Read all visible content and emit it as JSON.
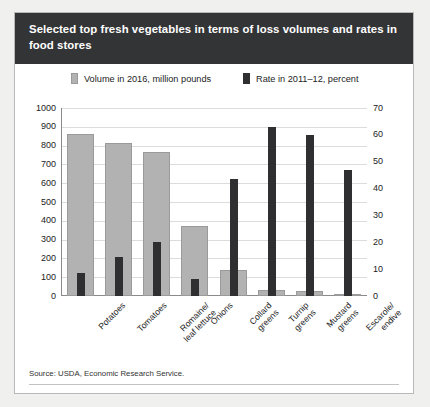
{
  "title": "Selected top fresh vegetables in terms of loss volumes and rates in food stores",
  "legend": {
    "volume": {
      "label": "Volume in 2016, million pounds",
      "color": "#b2b2b2",
      "icon": "square-swatch-gray"
    },
    "rate": {
      "label": "Rate in 2011–12, percent",
      "color": "#2f2f31",
      "icon": "square-swatch-black"
    }
  },
  "source": "Source: USDA, Economic Research Service.",
  "chart_data": {
    "type": "bar",
    "title": "Selected top fresh vegetables in terms of loss volumes and rates in food stores",
    "xlabel": "",
    "ylabel": "",
    "grid": true,
    "legend_position": "top",
    "categories": [
      "Potatoes",
      "Tomatoes",
      "Romaine/\nleaf lettuce",
      "Onions",
      "Collard\ngreens",
      "Turnip\ngreens",
      "Mustard\ngreens",
      "Escarole/\nendive"
    ],
    "series": [
      {
        "name": "Volume in 2016, million pounds",
        "axis": "left",
        "color": "#b2b2b2",
        "values": [
          860,
          815,
          765,
          370,
          140,
          30,
          25,
          5
        ]
      },
      {
        "name": "Rate in 2011–12, percent",
        "axis": "right",
        "color": "#2f2f31",
        "values": [
          8.5,
          14.5,
          20,
          6.5,
          43.5,
          63,
          60,
          47
        ]
      }
    ],
    "left_axis": {
      "label": "million pounds",
      "ylim": [
        0,
        1000
      ],
      "ticks": [
        0,
        100,
        200,
        300,
        400,
        500,
        600,
        700,
        800,
        900,
        1000
      ]
    },
    "right_axis": {
      "label": "percent",
      "ylim": [
        0,
        70
      ],
      "ticks": [
        0,
        10,
        20,
        30,
        40,
        50,
        60,
        70
      ]
    }
  }
}
